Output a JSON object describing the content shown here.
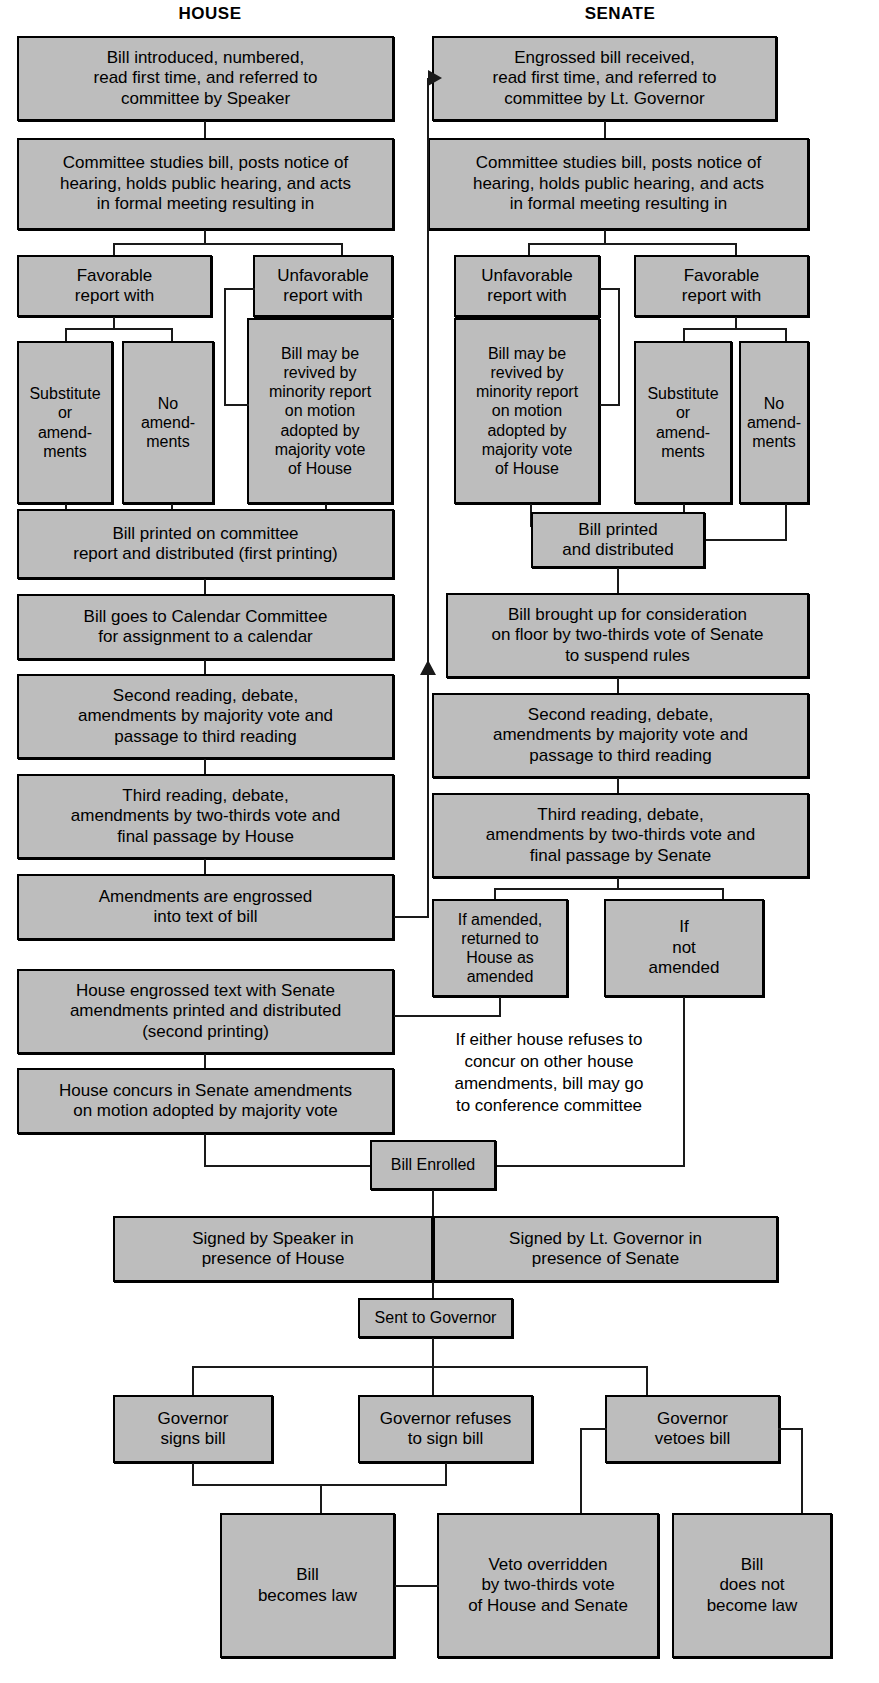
{
  "diagram": {
    "columns": [
      {
        "id": "house",
        "label": "HOUSE"
      },
      {
        "id": "senate",
        "label": "SENATE"
      }
    ],
    "colors": {
      "box_fill": "#bdbdbd",
      "box_border": "#000000",
      "line": "#1a1a1a",
      "background": "#ffffff",
      "text": "#000000"
    },
    "nodes": {
      "h_intro": "Bill introduced, numbered,\nread first time, and referred to\ncommittee by Speaker",
      "h_committee": "Committee studies bill, posts notice of\nhearing, holds public hearing, and acts\nin formal meeting resulting in",
      "h_favorable": "Favorable\nreport with",
      "h_unfavorable": "Unfavorable\nreport with",
      "h_substitute": "Substitute\nor\namend-\nments",
      "h_noamend": "No\namend-\nments",
      "h_revived": "Bill may be\nrevived by\nminority report\non motion\nadopted by\nmajority vote\nof House",
      "h_printed": "Bill printed on committee\nreport and distributed (first printing)",
      "h_calendar": "Bill goes to Calendar Committee\nfor assignment to a calendar",
      "h_second": "Second reading, debate,\namendments by majority vote and\npassage to third reading",
      "h_third": "Third reading, debate,\namendments by two-thirds vote and\nfinal passage by House",
      "h_engrossed": "Amendments are engrossed\ninto text of bill",
      "h_engrossed_text": "House engrossed text with Senate\namendments printed and distributed\n(second printing)",
      "h_concurs": "House concurs in Senate amendments\non motion adopted by majority vote",
      "s_intro": "Engrossed bill received,\nread first time, and referred to\ncommittee by Lt. Governor",
      "s_committee": "Committee studies bill, posts notice of\nhearing, holds public hearing, and acts\nin formal meeting resulting in",
      "s_unfavorable": "Unfavorable\nreport with",
      "s_favorable": "Favorable\nreport with",
      "s_revived": "Bill may be\nrevived by\nminority report\non motion\nadopted by\nmajority vote\nof House",
      "s_substitute": "Substitute\nor\namend-\nments",
      "s_noamend": "No\namend-\nments",
      "s_printed": "Bill printed\nand distributed",
      "s_brought_up": "Bill brought up for consideration\non floor by two-thirds vote of Senate\nto suspend rules",
      "s_second": "Second reading, debate,\namendments by majority vote and\npassage to third reading",
      "s_third": "Third reading, debate,\namendments by two-thirds vote and\nfinal passage by Senate",
      "s_if_amended": "If amended,\nreturned to\nHouse as\namended",
      "s_not_amended": "If\nnot\namended",
      "conference_note": "If either house refuses to\nconcur on other house\namendments, bill may go\nto conference committee",
      "bill_enrolled": "Bill Enrolled",
      "signed_speaker": "Signed by Speaker in\npresence of House",
      "signed_ltgov": "Signed by Lt. Governor in\npresence of Senate",
      "sent_governor": "Sent to Governor",
      "gov_signs": "Governor\nsigns bill",
      "gov_refuses": "Governor refuses\nto sign bill",
      "gov_vetoes": "Governor\nvetoes bill",
      "becomes_law": "Bill\nbecomes law",
      "veto_overridden": "Veto overridden\nby two-thirds vote\nof House and Senate",
      "not_law": "Bill\ndoes not\nbecome law"
    }
  }
}
